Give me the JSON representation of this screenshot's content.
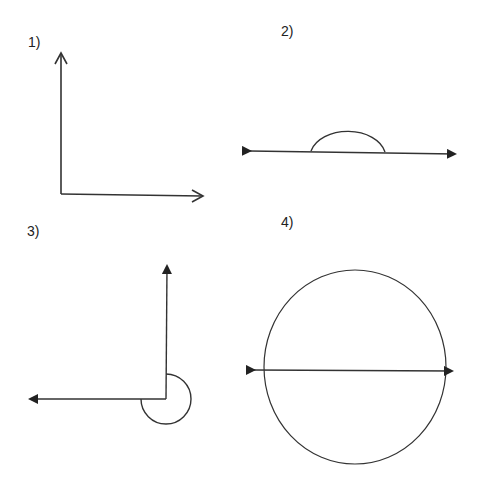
{
  "diagram": {
    "type": "angle-figures",
    "stroke_color": "#333333",
    "background": "#ffffff",
    "figures": [
      {
        "label": "1)",
        "description": "Right angle formed by vertical arrow up and horizontal arrow right (open arrowheads)"
      },
      {
        "label": "2)",
        "description": "Straight line with arrowheads on both ends and a semicircular arc marking a straight angle"
      },
      {
        "label": "3)",
        "description": "Reflex angle: arrow up and arrow left with a three-quarter circle arc around the vertex"
      },
      {
        "label": "4)",
        "description": "Full circle with a horizontal double-headed line through its center (full rotation)"
      }
    ]
  }
}
